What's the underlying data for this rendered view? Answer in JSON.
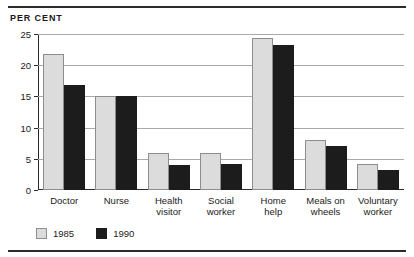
{
  "unit_label": "PER CENT",
  "chart_data": {
    "type": "bar",
    "title": "",
    "subtitle": "",
    "xlabel": "",
    "ylabel": "PER CENT",
    "ylim": [
      0,
      25
    ],
    "yticks": [
      0,
      5,
      10,
      15,
      20,
      25
    ],
    "ytick_labels": [
      "0",
      "5",
      "10",
      "15",
      "20",
      "25"
    ],
    "grid": true,
    "legend_position": "bottom-left",
    "categories": [
      "Doctor",
      "Nurse",
      "Health visitor",
      "Social worker",
      "Home help",
      "Meals on wheels",
      "Voluntary worker"
    ],
    "category_lines": [
      [
        "Doctor"
      ],
      [
        "Nurse"
      ],
      [
        "Health",
        "visitor"
      ],
      [
        "Social",
        "worker"
      ],
      [
        "Home",
        "help"
      ],
      [
        "Meals on",
        "wheels"
      ],
      [
        "Voluntary",
        "worker"
      ]
    ],
    "series": [
      {
        "name": "1985",
        "color": "#dcdcdc",
        "values": [
          21.8,
          15.0,
          6.0,
          6.0,
          24.3,
          8.0,
          4.2
        ]
      },
      {
        "name": "1990",
        "color": "#1c1c1c",
        "values": [
          16.8,
          15.0,
          4.0,
          4.2,
          23.2,
          7.0,
          3.2
        ]
      }
    ]
  },
  "legend": {
    "entries": [
      {
        "label": "1985",
        "swatch": "light"
      },
      {
        "label": "1990",
        "swatch": "dark"
      }
    ]
  }
}
